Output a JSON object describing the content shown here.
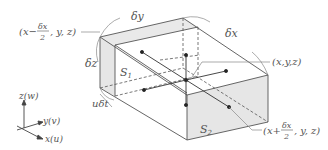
{
  "figure": {
    "labels": {
      "left_point": "(x−δx/2, y, z)",
      "left_point_parts": {
        "open": "(x−",
        "num": "δx",
        "den": "2",
        "close": ", y, z)"
      },
      "center_point": "(x,y,z)",
      "right_point": "(x+δx/2, y, z)",
      "right_point_parts": {
        "open": "(x+",
        "num": "δx",
        "den": "2",
        "close": ", y, z)"
      },
      "dx": "δx",
      "dy": "δy",
      "dz": "δz",
      "udt": "uδt",
      "s1": "S",
      "s1_sub": "1",
      "s2": "S",
      "s2_sub": "2"
    },
    "axes": {
      "z": "z(w)",
      "y": "y(v)",
      "x": "x(u)"
    },
    "colors": {
      "edge": "#555555",
      "face_fill": "#e6e6e6",
      "label": "#555555",
      "leader": "#888888"
    }
  }
}
